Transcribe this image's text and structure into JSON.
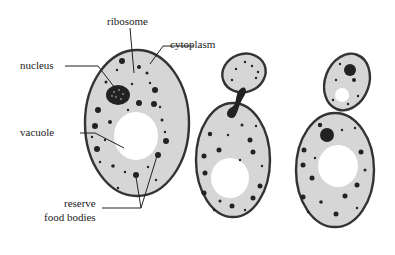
{
  "diagram": {
    "labels": {
      "ribosome": "ribosome",
      "cytoplasm": "cytoplasm",
      "nucleus": "nucleus",
      "vacuole": "vacuole",
      "reserve_line1": "reserve",
      "reserve_line2": "food bodies"
    },
    "cells": [
      {
        "name": "mature-cell",
        "stage": "single cell"
      },
      {
        "name": "budding-cell",
        "stage": "nucleus dividing into bud"
      },
      {
        "name": "daughter-cell-formed",
        "stage": "bud with own nucleus and vacuole"
      }
    ],
    "colors": {
      "cytoplasm": "#d6d6d6",
      "outline": "#333333",
      "vacuole": "#ffffff",
      "granules": "#222222"
    }
  }
}
